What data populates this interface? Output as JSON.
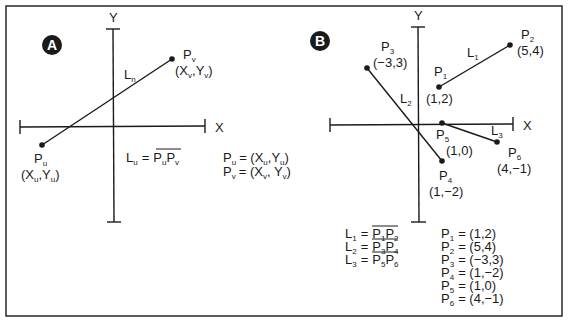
{
  "panel_a": {
    "badge": "A",
    "axes": {
      "x_label": "X",
      "y_label": "Y"
    },
    "line_label": {
      "main": "L",
      "sub": "n"
    },
    "point_u": {
      "name": "P",
      "name_sub": "u",
      "coord": [
        "X",
        "u",
        "Y",
        "u"
      ]
    },
    "point_v": {
      "name": "P",
      "name_sub": "v",
      "coord": [
        "X",
        "v",
        "Y",
        "v"
      ]
    },
    "definition": {
      "lhs": "L",
      "lhs_sub": "u",
      "eq": "=",
      "seg_a": "P",
      "seg_a_sub": "u",
      "seg_b": "P",
      "seg_b_sub": "v"
    },
    "legend": [
      {
        "name": "P",
        "sub": "u",
        "value": "= (X",
        "vsub1": "u",
        "mid": ",Y",
        "vsub2": "u",
        "end": ")"
      },
      {
        "name": "P",
        "sub": "v",
        "value": "= (X",
        "vsub1": "v",
        "mid": ", Y",
        "vsub2": "v",
        "end": ")"
      }
    ]
  },
  "panel_b": {
    "badge": "B",
    "axes": {
      "x_label": "X",
      "y_label": "Y"
    },
    "points": [
      {
        "name": "P",
        "sub": "1",
        "coord": "(1,2)"
      },
      {
        "name": "P",
        "sub": "2",
        "coord": "(5,4)"
      },
      {
        "name": "P",
        "sub": "3",
        "coord": "(−3,3)"
      },
      {
        "name": "P",
        "sub": "4",
        "coord": "(1,−2)"
      },
      {
        "name": "P",
        "sub": "5",
        "coord": "(1,0)"
      },
      {
        "name": "P",
        "sub": "6",
        "coord": "(4,−1)"
      }
    ],
    "lines": [
      {
        "name": "L",
        "sub": "1",
        "from": "P",
        "from_sub": "1",
        "to": "P",
        "to_sub": "2"
      },
      {
        "name": "L",
        "sub": "2",
        "from": "P",
        "from_sub": "3",
        "to": "P",
        "to_sub": "4"
      },
      {
        "name": "L",
        "sub": "3",
        "from": "P",
        "from_sub": "5",
        "to": "P",
        "to_sub": "6"
      }
    ],
    "eq": "=",
    "point_legend": [
      {
        "name": "P",
        "sub": "1",
        "value": "= (1,2)"
      },
      {
        "name": "P",
        "sub": "2",
        "value": "= (5,4)"
      },
      {
        "name": "P",
        "sub": "3",
        "value": "= (−3,3)"
      },
      {
        "name": "P",
        "sub": "4",
        "value": "= (1,−2)"
      },
      {
        "name": "P",
        "sub": "5",
        "value": "= (1,0)"
      },
      {
        "name": "P",
        "sub": "6",
        "value": "= (4,−1)"
      }
    ]
  },
  "colors": {
    "ink": "#1a1a1a",
    "background": "#ffffff"
  }
}
